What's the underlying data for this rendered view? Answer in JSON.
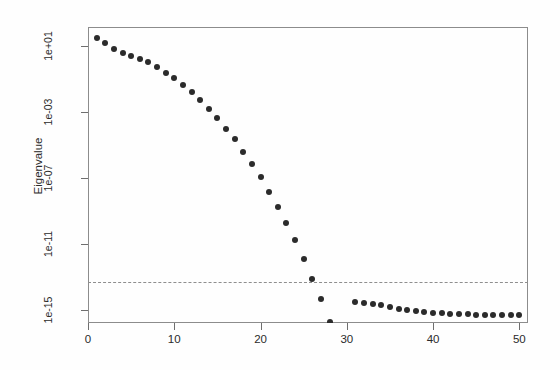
{
  "chart_data": {
    "type": "scatter",
    "title": "",
    "xlabel": "",
    "ylabel": "Eigenvalue",
    "yscale": "log",
    "xlim": [
      0,
      51
    ],
    "ylim": [
      1e-16,
      100.0
    ],
    "grid": false,
    "legend": null,
    "xticks": [
      0,
      10,
      20,
      30,
      40,
      50
    ],
    "xtick_labels": [
      "0",
      "10",
      "20",
      "30",
      "40",
      "50"
    ],
    "yticks": [
      10,
      0.001,
      1e-07,
      1e-11,
      1e-15
    ],
    "ytick_labels": [
      "1e+01",
      "1e-03",
      "1e-07",
      "1e-11",
      "1e-15"
    ],
    "annotations": [
      {
        "type": "hline",
        "y": 5e-14,
        "style": "dashed",
        "color": "#8e8e8e"
      }
    ],
    "marker": {
      "shape": "circle",
      "filled": true,
      "color": "#2b2b2b",
      "size": 6
    },
    "x": [
      1,
      2,
      3,
      4,
      5,
      6,
      7,
      8,
      9,
      10,
      11,
      12,
      13,
      14,
      15,
      16,
      17,
      18,
      19,
      20,
      21,
      22,
      23,
      24,
      25,
      26,
      27,
      28,
      29,
      30,
      31,
      32,
      33,
      34,
      35,
      36,
      37,
      38,
      39,
      40,
      41,
      42,
      43,
      44,
      45,
      46,
      47,
      48,
      49,
      50
    ],
    "values": [
      30.0,
      15.0,
      7.0,
      4.0,
      2.6,
      1.7,
      1.1,
      0.55,
      0.24,
      0.11,
      0.045,
      0.016,
      0.0055,
      0.0016,
      0.00045,
      0.0001,
      2.2e-05,
      4e-06,
      7e-07,
      1.1e-07,
      1.5e-08,
      1.8e-09,
      1.9e-10,
      1.7e-11,
      1.3e-12,
      8e-14,
      4.5e-15,
      2e-16,
      7e-18,
      1.6e-19,
      3e-15,
      2.6e-15,
      2.3e-15,
      2e-15,
      1.5e-15,
      1.2e-15,
      1e-15,
      8.5e-16,
      7.5e-16,
      6.8e-16,
      6.2e-16,
      5.8e-16,
      5.6e-16,
      5.4e-16,
      5.2e-16,
      5.1e-16,
      5e-16,
      4.9e-16,
      4.8e-16,
      4.7e-16
    ]
  },
  "axis": {
    "y_title": "Eigenvalue",
    "y_labels": [
      "1e+01",
      "1e-03",
      "1e-07",
      "1e-11",
      "1e-15"
    ],
    "x_labels": [
      "0",
      "10",
      "20",
      "30",
      "40",
      "50"
    ]
  }
}
